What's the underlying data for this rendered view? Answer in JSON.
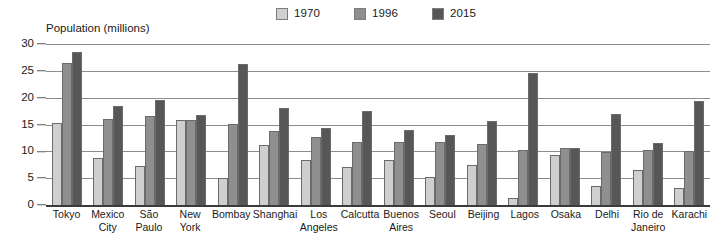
{
  "chart_data": {
    "type": "bar",
    "title": "",
    "ylabel": "Population (millions)",
    "xlabel": "",
    "ylim": [
      0,
      30
    ],
    "yticks": [
      30,
      25,
      20,
      15,
      10,
      5,
      0
    ],
    "grid": true,
    "legend_position": "top-center",
    "categories": [
      "Tokyo",
      "Mexico City",
      "São Paulo",
      "New York",
      "Bombay",
      "Shanghai",
      "Los Angeles",
      "Calcutta",
      "Buenos Aires",
      "Seoul",
      "Beijing",
      "Lagos",
      "Osaka",
      "Delhi",
      "Rio de Janeiro",
      "Karachi"
    ],
    "series": [
      {
        "name": "1970",
        "color": "#cfcfcf",
        "values": [
          15.3,
          8.7,
          7.2,
          15.8,
          5.0,
          11.2,
          8.4,
          7.1,
          8.4,
          5.3,
          7.4,
          1.4,
          9.4,
          3.5,
          6.6,
          3.1
        ]
      },
      {
        "name": "1996",
        "color": "#8f8f8f",
        "values": [
          26.5,
          16.0,
          16.5,
          15.9,
          15.1,
          13.7,
          12.6,
          11.7,
          11.8,
          11.8,
          11.3,
          10.3,
          10.6,
          9.9,
          10.2,
          10.0
        ]
      },
      {
        "name": "2015",
        "color": "#575757",
        "values": [
          28.5,
          18.5,
          19.5,
          16.8,
          26.2,
          18.0,
          14.3,
          17.6,
          13.9,
          13.0,
          15.6,
          24.6,
          10.6,
          16.9,
          11.6,
          19.4
        ]
      }
    ]
  }
}
